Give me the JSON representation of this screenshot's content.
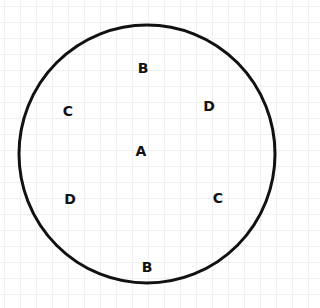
{
  "diagram": {
    "type": "circle-with-labels",
    "circle": {
      "cx": 147,
      "cy": 154,
      "rx": 128,
      "ry": 129,
      "stroke": "#111111",
      "stroke_width": 3
    },
    "labels": [
      {
        "id": "top-b",
        "text": "B",
        "x": 143,
        "y": 68
      },
      {
        "id": "left-c",
        "text": "C",
        "x": 68,
        "y": 111
      },
      {
        "id": "right-d",
        "text": "D",
        "x": 209,
        "y": 106
      },
      {
        "id": "center-a",
        "text": "A",
        "x": 141,
        "y": 151
      },
      {
        "id": "left-d",
        "text": "D",
        "x": 70,
        "y": 199
      },
      {
        "id": "right-c",
        "text": "C",
        "x": 218,
        "y": 198
      },
      {
        "id": "bottom-b",
        "text": "B",
        "x": 147,
        "y": 267
      }
    ]
  }
}
